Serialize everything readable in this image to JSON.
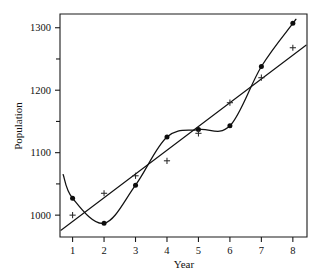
{
  "chart_data": {
    "type": "line",
    "title": "",
    "subtitle": "",
    "xlabel": "Year",
    "ylabel": "Population",
    "x": [
      1,
      2,
      3,
      4,
      5,
      6,
      7,
      8
    ],
    "xtick_labels": [
      "1",
      "2",
      "3",
      "4",
      "5",
      "6",
      "7",
      "8"
    ],
    "ytick_labels": [
      "1000",
      "1100",
      "1200",
      "1300"
    ],
    "ytick_values": [
      1000,
      1100,
      1200,
      1300
    ],
    "yminor_values": [
      1050,
      1150,
      1250
    ],
    "xlim": [
      0.6,
      8.45
    ],
    "ylim": [
      965,
      1322
    ],
    "grid": false,
    "legend": false,
    "legend_position": "none",
    "series": [
      {
        "name": "Observed population",
        "marker": "filled-circle",
        "line": "smooth-curve",
        "values": [
          1027,
          987,
          1048,
          1125,
          1137,
          1143,
          1238,
          1307
        ]
      },
      {
        "name": "Fitted trend",
        "marker": "plus",
        "line": "straight",
        "values": [
          1000,
          1035,
          1063,
          1087,
          1131,
          1180,
          1220,
          1268
        ]
      }
    ],
    "annotations": []
  },
  "axes": {
    "x_axis_title": "Year",
    "y_axis_title": "Population"
  },
  "colors": {
    "background": "#ffffff",
    "axis": "#1a1a1a",
    "curve_series": "#111111",
    "line_series": "#111111",
    "dot_marker": "#0d0d0d",
    "plus_marker": "#2a2a2a"
  }
}
